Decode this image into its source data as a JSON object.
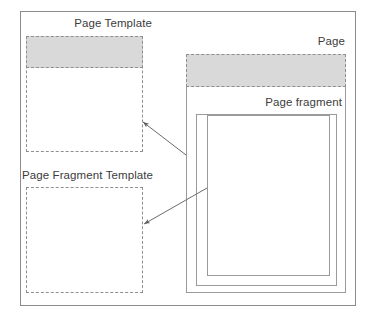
{
  "diagram": {
    "type": "block-diagram",
    "frame": {
      "name": "outer-frame"
    },
    "colors": {
      "band_fill": "#d9d9d9",
      "border_solid": "#9a9a9a",
      "border_dashed": "#8f8f8f",
      "frame_border": "#8c8c8c",
      "text": "#3c3c3c",
      "arrow": "#6b6b6b",
      "background": "#ffffff"
    },
    "labels": {
      "page_template": "Page Template",
      "page_fragment_template": "Page Fragment Template",
      "page": "Page",
      "page_fragment": "Page fragment"
    },
    "arrows": [
      {
        "name": "page-to-page-template-arrow",
        "from": "page-box-left-edge",
        "to": "page-template-box-right-edge",
        "direction": "right-to-left-up",
        "x1": 186,
        "y1": 155,
        "x2": 143,
        "y2": 122
      },
      {
        "name": "page-fragment-to-fragment-template-arrow",
        "from": "page-fragment-inner-box-left-edge",
        "to": "page-fragment-template-box-right-edge",
        "direction": "right-to-left-down",
        "x1": 207,
        "y1": 188,
        "x2": 144,
        "y2": 224
      }
    ]
  }
}
